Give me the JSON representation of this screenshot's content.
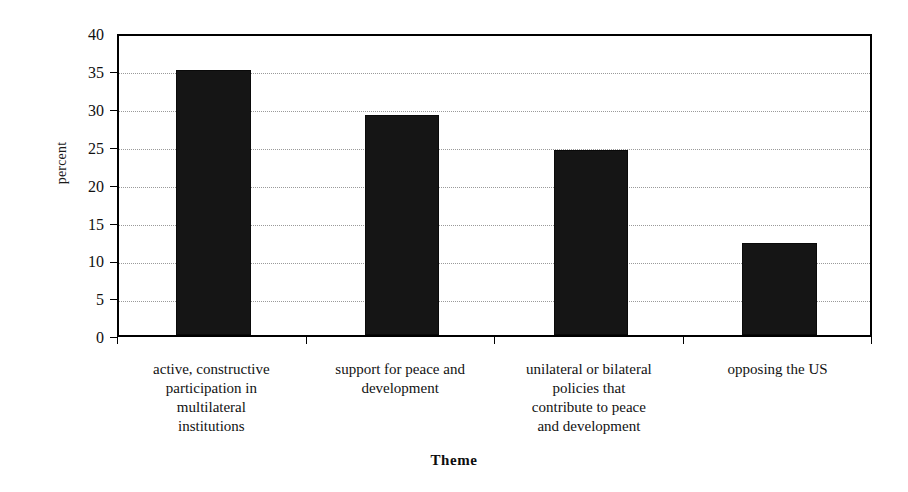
{
  "chart_data": {
    "type": "bar",
    "title": "",
    "xlabel": "Theme",
    "ylabel": "percent",
    "ylim": [
      0,
      40
    ],
    "ytick_step": 5,
    "yticks": [
      "40",
      "35",
      "30",
      "25",
      "20",
      "15",
      "10",
      "5",
      "0"
    ],
    "grid": true,
    "legend": "none",
    "bar_color": "#151515",
    "categories": [
      "active, constructive participation in multilateral institutions",
      "support for peace and development",
      "unilateral or bilateral policies that contribute to peace and development",
      "opposing the US"
    ],
    "category_lines": [
      [
        "active, constructive",
        "participation in",
        "multilateral",
        "institutions"
      ],
      [
        "support for peace and",
        "development"
      ],
      [
        "unilateral or bilateral",
        "policies that",
        "contribute to peace",
        "and development"
      ],
      [
        "opposing the US"
      ]
    ],
    "values": [
      35,
      29,
      24.4,
      12.2
    ]
  }
}
